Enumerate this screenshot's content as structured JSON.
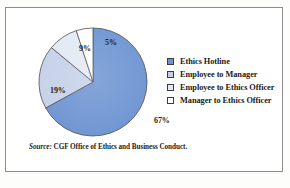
{
  "figure": {
    "source_prefix": "Source:",
    "source_text": " CGF Office of Ethics and Business Conduct."
  },
  "legend": {
    "items": [
      {
        "label": "Ethics Hotline",
        "color": "#6E95D2"
      },
      {
        "label": "Employee to Manager",
        "color": "#C6D1E8"
      },
      {
        "label": "Employee to Ethics Officer",
        "color": "#E3E9F4"
      },
      {
        "label": "Manager to Ethics Officer",
        "color": "#FFFFFF"
      }
    ]
  },
  "chart_data": {
    "type": "pie",
    "title": "",
    "subtitle": "",
    "xlabel": "",
    "ylabel": "",
    "legend_position": "right",
    "grid": false,
    "labels": [
      "Ethics Hotline",
      "Employee to Manager",
      "Employee to Ethics Officer",
      "Manager to Ethics Officer"
    ],
    "values": [
      67,
      19,
      9,
      5
    ],
    "value_labels": [
      "67%",
      "19%",
      "9%",
      "5%"
    ],
    "colors": [
      "#6E95D2",
      "#C6D1E8",
      "#E3E9F4",
      "#FFFFFF"
    ],
    "units": "percent",
    "total": 100,
    "start_angle_deg": 0,
    "direction": "clockwise",
    "annotations": [
      "Source: CGF Office of Ethics and Business Conduct."
    ]
  }
}
